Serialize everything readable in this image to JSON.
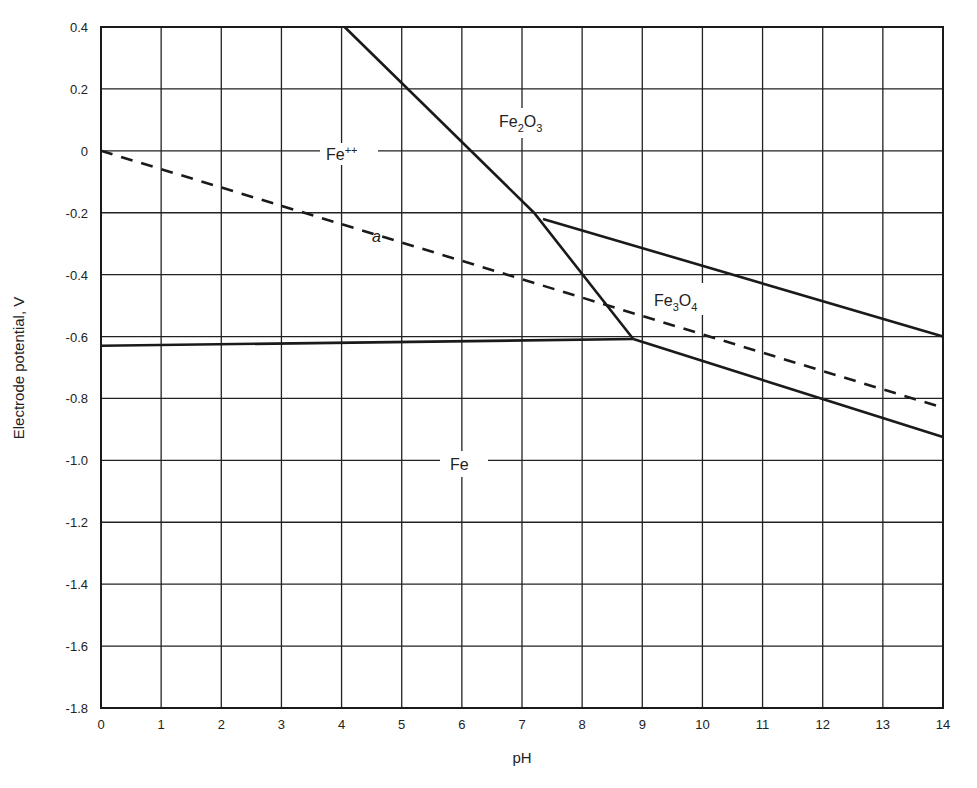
{
  "chart_data": {
    "type": "line",
    "title": "",
    "xlabel": "pH",
    "ylabel": "Electrode potential, V",
    "xlim": [
      0,
      14
    ],
    "ylim": [
      -1.8,
      0.4
    ],
    "grid": true,
    "x_ticks": [
      "0",
      "1",
      "2",
      "3",
      "4",
      "5",
      "6",
      "7",
      "8",
      "9",
      "10",
      "11",
      "12",
      "13",
      "14"
    ],
    "y_ticks": [
      "0.4",
      "0.2",
      "0",
      "-0.2",
      "-0.4",
      "-0.6",
      "-0.8",
      "-1.0",
      "-1.2",
      "-1.4",
      "-1.6",
      "-1.8"
    ],
    "y_tick_values": [
      0.4,
      0.2,
      0,
      -0.2,
      -0.4,
      -0.6,
      -0.8,
      -1.0,
      -1.2,
      -1.4,
      -1.6,
      -1.8
    ],
    "series": [
      {
        "name": "Fe++ / Fe2O3 boundary",
        "style": "solid",
        "points": [
          [
            4.05,
            0.4
          ],
          [
            7.2,
            -0.2
          ],
          [
            8.85,
            -0.608
          ]
        ]
      },
      {
        "name": "Fe2O3 / Fe3O4 boundary",
        "style": "solid",
        "points": [
          [
            7.35,
            -0.22
          ],
          [
            14.0,
            -0.6
          ]
        ]
      },
      {
        "name": "Fe / Fe++ boundary",
        "style": "solid",
        "points": [
          [
            0,
            -0.63
          ],
          [
            8.85,
            -0.608
          ]
        ]
      },
      {
        "name": "Fe / Fe3O4 boundary",
        "style": "solid",
        "points": [
          [
            8.85,
            -0.608
          ],
          [
            14.0,
            -0.925
          ]
        ]
      },
      {
        "name": "a (hydrogen line)",
        "style": "dashed",
        "points": [
          [
            0,
            0.0
          ],
          [
            14.0,
            -0.83
          ]
        ]
      }
    ],
    "annotations": [
      {
        "text": "Fe++",
        "x": 4.2,
        "y": 0.0
      },
      {
        "text": "Fe2O3",
        "x": 6.95,
        "y": 0.1
      },
      {
        "text": "Fe3O4",
        "x": 9.55,
        "y": -0.5
      },
      {
        "text": "Fe",
        "x": 6.2,
        "y": -1.02
      },
      {
        "text": "a",
        "x": 4.6,
        "y": -0.27
      }
    ]
  },
  "labels": {
    "xlabel": "pH",
    "ylabel": "Electrode potential, V",
    "fe_ion": "Fe",
    "fe_ion_sup": "++",
    "fe2o3_a": "Fe",
    "fe2o3_b": "2",
    "fe2o3_c": "O",
    "fe2o3_d": "3",
    "fe3o4_a": "Fe",
    "fe3o4_b": "3",
    "fe3o4_c": "O",
    "fe3o4_d": "4",
    "fe": "Fe",
    "a": "a"
  }
}
